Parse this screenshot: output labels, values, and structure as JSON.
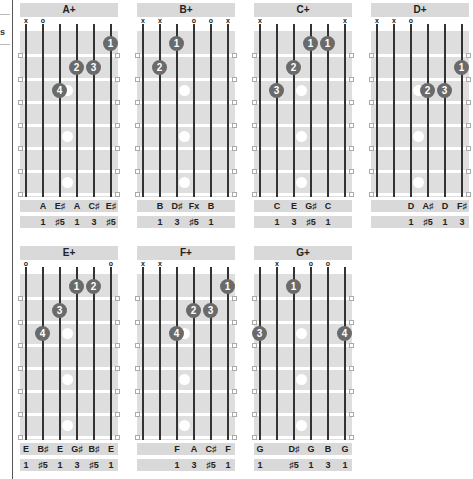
{
  "page": {
    "sidebar_fragment": {
      "letter": "s"
    }
  },
  "layout": {
    "string_x": [
      5,
      22,
      39,
      56,
      73,
      90
    ],
    "fret_y": [
      7,
      31,
      55,
      78,
      101,
      124,
      147,
      170
    ],
    "inlays_fret": [
      3,
      5,
      7
    ]
  },
  "chords": [
    {
      "name": "A+",
      "left": 20,
      "top": 3,
      "markers": [
        "x",
        "o",
        "",
        "",
        "",
        ""
      ],
      "fingers": [
        {
          "string": 6,
          "fret": 1,
          "label": "1"
        },
        {
          "string": 4,
          "fret": 2,
          "label": "2"
        },
        {
          "string": 5,
          "fret": 2,
          "label": "3"
        },
        {
          "string": 3,
          "fret": 3,
          "label": "4"
        }
      ],
      "notes": [
        "",
        "A",
        "E♯",
        "A",
        "C♯",
        "E♯"
      ],
      "intervals": [
        "",
        "1",
        "♯5",
        "1",
        "3",
        "♯5"
      ]
    },
    {
      "name": "B+",
      "left": 137,
      "top": 3,
      "markers": [
        "x",
        "x",
        "",
        "o",
        "o",
        "x"
      ],
      "fingers": [
        {
          "string": 3,
          "fret": 1,
          "label": "1"
        },
        {
          "string": 2,
          "fret": 2,
          "label": "2"
        }
      ],
      "notes": [
        "",
        "B",
        "D♯",
        "Fx",
        "B",
        ""
      ],
      "intervals": [
        "",
        "1",
        "3",
        "♯5",
        "1",
        ""
      ]
    },
    {
      "name": "C+",
      "left": 254,
      "top": 3,
      "markers": [
        "x",
        "",
        "",
        "",
        "",
        "x"
      ],
      "fingers": [
        {
          "string": 4,
          "fret": 1,
          "label": "1"
        },
        {
          "string": 5,
          "fret": 1,
          "label": "1"
        },
        {
          "string": 3,
          "fret": 2,
          "label": "2"
        },
        {
          "string": 2,
          "fret": 3,
          "label": "3"
        }
      ],
      "notes": [
        "",
        "C",
        "E",
        "G♯",
        "C",
        ""
      ],
      "intervals": [
        "",
        "1",
        "3",
        "♯5",
        "1",
        ""
      ]
    },
    {
      "name": "D+",
      "left": 371,
      "top": 3,
      "markers": [
        "x",
        "x",
        "o",
        "",
        "",
        ""
      ],
      "fingers": [
        {
          "string": 6,
          "fret": 2,
          "label": "1"
        },
        {
          "string": 4,
          "fret": 3,
          "label": "2"
        },
        {
          "string": 5,
          "fret": 3,
          "label": "3"
        }
      ],
      "notes": [
        "",
        "",
        "D",
        "A♯",
        "D",
        "F♯"
      ],
      "intervals": [
        "",
        "",
        "1",
        "♯5",
        "1",
        "3"
      ]
    },
    {
      "name": "E+",
      "left": 20,
      "top": 246,
      "markers": [
        "o",
        "",
        "",
        "",
        "",
        "o"
      ],
      "fingers": [
        {
          "string": 4,
          "fret": 1,
          "label": "1"
        },
        {
          "string": 5,
          "fret": 1,
          "label": "2"
        },
        {
          "string": 3,
          "fret": 2,
          "label": "3"
        },
        {
          "string": 2,
          "fret": 3,
          "label": "4"
        }
      ],
      "notes": [
        "E",
        "B♯",
        "E",
        "G♯",
        "B♯",
        "E"
      ],
      "intervals": [
        "1",
        "♯5",
        "1",
        "3",
        "♯5",
        "1"
      ]
    },
    {
      "name": "F+",
      "left": 137,
      "top": 246,
      "markers": [
        "x",
        "x",
        "",
        "",
        "",
        ""
      ],
      "fingers": [
        {
          "string": 6,
          "fret": 1,
          "label": "1"
        },
        {
          "string": 4,
          "fret": 2,
          "label": "2"
        },
        {
          "string": 5,
          "fret": 2,
          "label": "3"
        },
        {
          "string": 3,
          "fret": 3,
          "label": "4"
        }
      ],
      "notes": [
        "",
        "",
        "F",
        "A",
        "C♯",
        "F"
      ],
      "intervals": [
        "",
        "",
        "1",
        "3",
        "♯5",
        "1"
      ]
    },
    {
      "name": "G+",
      "left": 254,
      "top": 246,
      "markers": [
        "",
        "x",
        "",
        "o",
        "o",
        ""
      ],
      "fingers": [
        {
          "string": 3,
          "fret": 1,
          "label": "1"
        },
        {
          "string": 1,
          "fret": 3,
          "label": "3"
        },
        {
          "string": 6,
          "fret": 3,
          "label": "4"
        }
      ],
      "notes": [
        "G",
        "",
        "D♯",
        "G",
        "B",
        "G"
      ],
      "intervals": [
        "1",
        "",
        "♯5",
        "1",
        "3",
        "1"
      ]
    }
  ]
}
